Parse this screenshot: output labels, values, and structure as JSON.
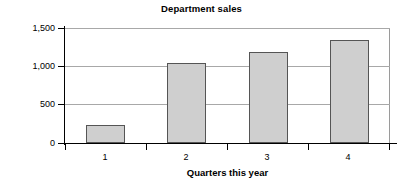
{
  "chart_data": {
    "type": "bar",
    "title": "Department sales",
    "xlabel": "Quarters this year",
    "ylabel": "Sales in thousands",
    "categories": [
      "1",
      "2",
      "3",
      "4"
    ],
    "values": [
      235,
      1050,
      1190,
      1340
    ],
    "ylim": [
      0,
      1500
    ],
    "yticks": [
      0,
      500,
      1000,
      1500
    ],
    "ytick_labels": [
      "0",
      "500",
      "1,000",
      "1,500"
    ],
    "grid": true,
    "legend": null,
    "series": [
      {
        "name": "Sales",
        "values": [
          235,
          1050,
          1190,
          1340
        ]
      }
    ],
    "colors": {
      "bar_fill": "#cfcfcf",
      "bar_border": "#555555",
      "gridline": "#a8a8a8",
      "axis": "#000000",
      "background": "#ffffff"
    }
  }
}
